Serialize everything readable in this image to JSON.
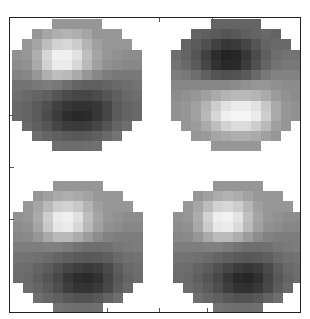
{
  "chart_data": {
    "type": "heatmap",
    "title": "",
    "xlabel": "",
    "ylabel": "",
    "grid": false,
    "colormap": "grayscale",
    "value_range": [
      0,
      255
    ],
    "grid_size": [
      13,
      13
    ],
    "mask_row_spans": [
      [
        4,
        8
      ],
      [
        2,
        10
      ],
      [
        1,
        11
      ],
      [
        0,
        12
      ],
      [
        0,
        12
      ],
      [
        0,
        12
      ],
      [
        0,
        12
      ],
      [
        0,
        12
      ],
      [
        0,
        12
      ],
      [
        0,
        12
      ],
      [
        1,
        11
      ],
      [
        2,
        10
      ],
      [
        4,
        8
      ]
    ],
    "panels": [
      {
        "name": "top-left",
        "position": {
          "left": 2,
          "top": 1
        },
        "description": "bright spot upper-left, dark spot lower-center-right",
        "values": [
          [
            150,
            150,
            150,
            150,
            150,
            150,
            150,
            150,
            150,
            150,
            150,
            150,
            150
          ],
          [
            150,
            150,
            150,
            165,
            175,
            180,
            175,
            165,
            150,
            150,
            150,
            150,
            150
          ],
          [
            150,
            150,
            165,
            190,
            210,
            215,
            205,
            180,
            160,
            150,
            150,
            150,
            150
          ],
          [
            145,
            150,
            175,
            215,
            240,
            240,
            225,
            190,
            165,
            150,
            145,
            140,
            140
          ],
          [
            140,
            145,
            170,
            210,
            235,
            235,
            215,
            185,
            160,
            145,
            140,
            135,
            135
          ],
          [
            130,
            135,
            150,
            175,
            190,
            185,
            170,
            150,
            135,
            125,
            120,
            120,
            120
          ],
          [
            115,
            115,
            120,
            125,
            120,
            110,
            100,
            95,
            95,
            100,
            105,
            110,
            115
          ],
          [
            110,
            105,
            100,
            95,
            85,
            75,
            70,
            70,
            75,
            85,
            95,
            105,
            110
          ],
          [
            105,
            100,
            90,
            80,
            65,
            55,
            50,
            50,
            55,
            70,
            90,
            100,
            105
          ],
          [
            105,
            100,
            90,
            75,
            60,
            45,
            40,
            42,
            55,
            70,
            90,
            100,
            105
          ],
          [
            110,
            105,
            95,
            85,
            70,
            60,
            58,
            60,
            70,
            85,
            100,
            110,
            110
          ],
          [
            115,
            115,
            110,
            100,
            95,
            90,
            88,
            90,
            95,
            105,
            115,
            115,
            115
          ],
          [
            120,
            120,
            120,
            115,
            110,
            108,
            108,
            110,
            112,
            115,
            120,
            120,
            120
          ]
        ]
      },
      {
        "name": "top-right",
        "position": {
          "left": 161,
          "top": 1
        },
        "description": "dark spot upper-center, bright spot lower-center-right",
        "values": [
          [
            100,
            100,
            100,
            100,
            100,
            100,
            100,
            100,
            100,
            100,
            100,
            100,
            100
          ],
          [
            100,
            100,
            100,
            95,
            90,
            85,
            88,
            95,
            100,
            105,
            100,
            100,
            100
          ],
          [
            105,
            100,
            90,
            80,
            65,
            55,
            58,
            70,
            85,
            100,
            105,
            105,
            105
          ],
          [
            110,
            100,
            85,
            65,
            45,
            35,
            38,
            55,
            75,
            95,
            110,
            115,
            115
          ],
          [
            115,
            105,
            90,
            70,
            50,
            40,
            42,
            60,
            80,
            100,
            115,
            120,
            120
          ],
          [
            125,
            120,
            110,
            95,
            85,
            80,
            82,
            90,
            105,
            120,
            130,
            130,
            130
          ],
          [
            135,
            135,
            135,
            135,
            135,
            135,
            140,
            145,
            150,
            150,
            145,
            140,
            140
          ],
          [
            140,
            145,
            150,
            160,
            170,
            180,
            185,
            185,
            180,
            170,
            155,
            145,
            140
          ],
          [
            145,
            150,
            160,
            180,
            205,
            225,
            235,
            235,
            225,
            200,
            170,
            150,
            145
          ],
          [
            145,
            150,
            160,
            185,
            215,
            240,
            245,
            245,
            235,
            205,
            170,
            150,
            145
          ],
          [
            145,
            150,
            155,
            170,
            190,
            210,
            220,
            220,
            205,
            185,
            160,
            150,
            145
          ],
          [
            150,
            150,
            150,
            155,
            165,
            170,
            175,
            175,
            170,
            160,
            150,
            150,
            150
          ],
          [
            150,
            150,
            150,
            150,
            150,
            150,
            150,
            150,
            150,
            150,
            150,
            150,
            150
          ]
        ]
      },
      {
        "name": "bottom-left",
        "position": {
          "left": 3,
          "top": 163
        },
        "description": "bright spot upper-left-center, dark spot lower-center-right",
        "values": [
          [
            150,
            150,
            150,
            150,
            150,
            150,
            150,
            150,
            150,
            150,
            150,
            150,
            150
          ],
          [
            150,
            150,
            150,
            160,
            170,
            175,
            170,
            162,
            152,
            150,
            150,
            150,
            150
          ],
          [
            150,
            150,
            165,
            185,
            205,
            210,
            200,
            180,
            160,
            150,
            150,
            150,
            150
          ],
          [
            145,
            150,
            170,
            205,
            235,
            240,
            225,
            190,
            165,
            150,
            145,
            140,
            140
          ],
          [
            140,
            145,
            165,
            200,
            230,
            235,
            215,
            185,
            160,
            145,
            140,
            135,
            135
          ],
          [
            135,
            138,
            150,
            170,
            185,
            185,
            172,
            155,
            140,
            130,
            125,
            125,
            125
          ],
          [
            125,
            125,
            125,
            128,
            128,
            122,
            115,
            110,
            110,
            112,
            118,
            122,
            125
          ],
          [
            115,
            115,
            112,
            108,
            100,
            95,
            90,
            88,
            90,
            95,
            105,
            112,
            115
          ],
          [
            110,
            108,
            100,
            92,
            80,
            70,
            62,
            58,
            62,
            75,
            92,
            105,
            110
          ],
          [
            108,
            105,
            95,
            85,
            72,
            55,
            45,
            42,
            50,
            68,
            88,
            100,
            108
          ],
          [
            110,
            108,
            100,
            90,
            78,
            62,
            52,
            50,
            58,
            72,
            92,
            105,
            110
          ],
          [
            115,
            115,
            110,
            102,
            95,
            88,
            82,
            82,
            88,
            98,
            110,
            115,
            115
          ],
          [
            120,
            120,
            120,
            118,
            115,
            112,
            110,
            110,
            112,
            115,
            120,
            120,
            120
          ]
        ]
      },
      {
        "name": "bottom-right",
        "position": {
          "left": 163,
          "top": 163
        },
        "description": "bright spot upper-left-center, dark spot lower-center-right",
        "values": [
          [
            150,
            150,
            150,
            150,
            150,
            150,
            150,
            150,
            150,
            150,
            150,
            150,
            150
          ],
          [
            150,
            150,
            150,
            160,
            172,
            178,
            172,
            162,
            152,
            150,
            150,
            150,
            150
          ],
          [
            150,
            150,
            165,
            188,
            210,
            215,
            205,
            182,
            160,
            150,
            150,
            150,
            150
          ],
          [
            145,
            150,
            172,
            210,
            238,
            242,
            228,
            192,
            165,
            150,
            145,
            140,
            140
          ],
          [
            140,
            145,
            168,
            202,
            232,
            236,
            218,
            186,
            160,
            145,
            140,
            135,
            135
          ],
          [
            135,
            138,
            150,
            170,
            186,
            186,
            174,
            156,
            140,
            130,
            125,
            125,
            125
          ],
          [
            125,
            125,
            125,
            128,
            128,
            122,
            115,
            110,
            110,
            112,
            118,
            122,
            125
          ],
          [
            115,
            115,
            112,
            108,
            100,
            95,
            90,
            88,
            90,
            95,
            105,
            112,
            115
          ],
          [
            110,
            108,
            100,
            92,
            80,
            70,
            60,
            55,
            60,
            75,
            92,
            105,
            110
          ],
          [
            108,
            105,
            95,
            85,
            72,
            55,
            42,
            38,
            48,
            68,
            88,
            100,
            108
          ],
          [
            110,
            108,
            100,
            90,
            78,
            62,
            50,
            48,
            56,
            72,
            92,
            105,
            110
          ],
          [
            115,
            115,
            110,
            102,
            95,
            88,
            82,
            82,
            88,
            98,
            110,
            115,
            115
          ],
          [
            120,
            120,
            120,
            118,
            115,
            112,
            110,
            110,
            112,
            115,
            120,
            120,
            120
          ]
        ]
      }
    ],
    "axis_ticks": {
      "left_y": [
        97,
        149,
        201
      ],
      "bottom_x": [
        97,
        149,
        197
      ],
      "top_x": [
        149,
        202
      ]
    }
  }
}
